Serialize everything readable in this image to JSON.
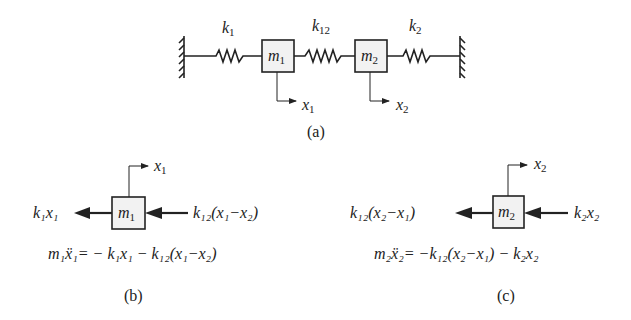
{
  "figure_a": {
    "caption": "(a)",
    "spring_labels": {
      "k1": "k",
      "k1_sub": "1",
      "k12": "k",
      "k12_sub": "12",
      "k2": "k",
      "k2_sub": "2"
    },
    "masses": [
      {
        "m": "m",
        "sub": "1"
      },
      {
        "m": "m",
        "sub": "2"
      }
    ],
    "displacements": [
      {
        "x": "x",
        "sub": "1"
      },
      {
        "x": "x",
        "sub": "2"
      }
    ]
  },
  "figure_b": {
    "caption": "(b)",
    "mass": {
      "m": "m",
      "sub": "1"
    },
    "displacement": {
      "x": "x",
      "sub": "1"
    },
    "left_force": "k₁x₁",
    "right_force": "k₁₂(x₁−x₂)",
    "equation": "m₁ẍ₁= − k₁x₁ − k₁₂(x₁−x₂)"
  },
  "figure_c": {
    "caption": "(c)",
    "mass": {
      "m": "m",
      "sub": "2"
    },
    "displacement": {
      "x": "x",
      "sub": "2"
    },
    "left_force": "k₁₂(x₂−x₁)",
    "right_force": "k₂x₂",
    "equation": "m₂ẍ₂= −k₁₂(x₂−x₁) − k₂x₂"
  }
}
